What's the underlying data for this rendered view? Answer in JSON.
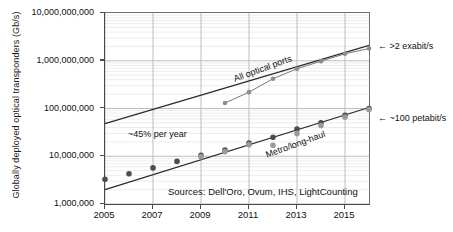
{
  "chart_data": {
    "type": "scatter",
    "title": "",
    "xlabel": "",
    "ylabel": "Globally deployed optical transponders (Gb/s)",
    "yscale": "log",
    "ylim": [
      1000000,
      10000000000
    ],
    "xlim": [
      2005,
      2016
    ],
    "grid": true,
    "legend": "none",
    "ytick_labels": [
      "10,000,000,000",
      "1,000,000,000",
      "100,000,000",
      "10,000,000",
      "1,000,000"
    ],
    "ytick_values": [
      10000000000,
      1000000000,
      100000000,
      10000000,
      1000000
    ],
    "xtick_labels": [
      "2005",
      "2007",
      "2009",
      "2011",
      "2013",
      "2015"
    ],
    "xtick_values": [
      2005,
      2007,
      2009,
      2011,
      2013,
      2015
    ],
    "series": [
      {
        "name": "All optical ports",
        "label": "All optical ports",
        "marker": "circle",
        "color": "#8c8c8c",
        "x": [
          2010,
          2011,
          2012,
          2013,
          2014,
          2015,
          2016
        ],
        "values": [
          130000000,
          220000000,
          420000000,
          680000000,
          980000000,
          1400000000,
          1800000000
        ]
      },
      {
        "name": "Metro/long-haul",
        "label": "Metro/long-haul",
        "marker": "circle",
        "color": "#4d4d4d",
        "x": [
          2005,
          2006,
          2007,
          2008,
          2009,
          2010,
          2011,
          2012,
          2013,
          2014,
          2015,
          2016
        ],
        "values": [
          3300000,
          4300000,
          5700000,
          7800000,
          10500000,
          13500000,
          19000000,
          25000000,
          37000000,
          50000000,
          72000000,
          100000000
        ]
      },
      {
        "name": "Metro/long-haul (secondary estimates)",
        "label": "",
        "marker": "circle",
        "color": "#9a9a9a",
        "x": [
          2009,
          2010,
          2011,
          2012,
          2013,
          2014,
          2015,
          2016
        ],
        "values": [
          9800000,
          12500000,
          17500000,
          17000000,
          30000000,
          44000000,
          66000000,
          95000000
        ]
      }
    ],
    "trendlines": [
      {
        "name": "All optical ports trend",
        "rate_label": "",
        "x": [
          2005,
          2016
        ],
        "values": [
          48000000,
          2100000000
        ]
      },
      {
        "name": "Metro/long-haul trend",
        "rate_label": "~45% per year",
        "x": [
          2005,
          2016
        ],
        "values": [
          2000000,
          105000000
        ]
      }
    ],
    "annotations": [
      {
        "name": "growth-rate",
        "text": "~45% per year"
      },
      {
        "name": "upper-series-label",
        "text": "All optical ports"
      },
      {
        "name": "lower-series-label",
        "text": "Metro/long-haul"
      },
      {
        "name": "sources",
        "text": "Sources: Dell'Oro, Ovum, IHS, LightCounting"
      },
      {
        "name": "right-upper-callout",
        "text": "← >2 exabit/s"
      },
      {
        "name": "right-lower-callout",
        "text": "← ~100 petabit/s"
      }
    ],
    "colors": {
      "axis": "#4a4a4a",
      "grid_major": "#b5b5b5",
      "grid_minor": "#dcdcdc",
      "marker_dark": "#4d4d4d",
      "marker_light": "#9a9a9a",
      "trendline": "#2b2b2b",
      "background": "#ffffff"
    }
  }
}
